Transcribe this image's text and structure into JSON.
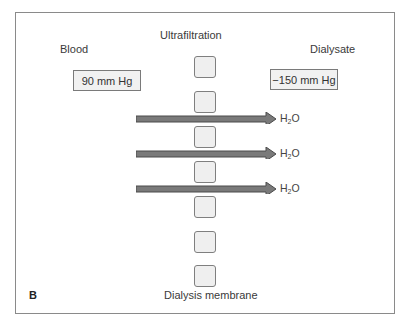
{
  "diagram": {
    "title": "Ultrafiltration",
    "left_label": "Blood",
    "right_label": "Dialysate",
    "left_pressure": "90 mm Hg",
    "right_pressure": "−150 mm Hg",
    "membrane_label": "Dialysis membrane",
    "panel_label": "B",
    "flows": [
      {
        "label_main": "H",
        "label_sub": "2",
        "label_end": "O"
      },
      {
        "label_main": "H",
        "label_sub": "2",
        "label_end": "O"
      },
      {
        "label_main": "H",
        "label_sub": "2",
        "label_end": "O"
      }
    ],
    "pore_count": 7,
    "colors": {
      "arrow_fill": "#7a7a7a",
      "arrow_stroke": "#4a4a4a",
      "border": "#8a8a8a",
      "box_fill": "#f1f1f1"
    }
  }
}
